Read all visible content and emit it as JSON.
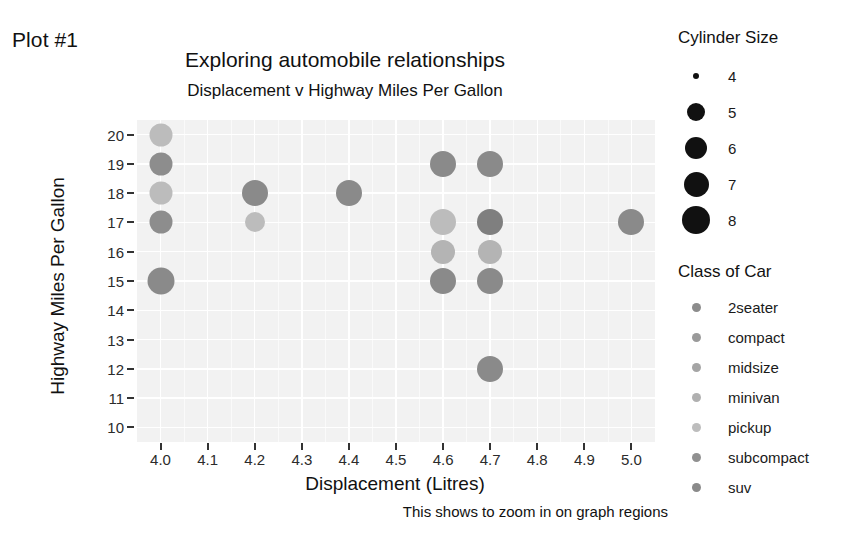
{
  "figure": {
    "plot_label": "Plot #1",
    "title": "Exploring automobile relationships",
    "subtitle": "Displacement v Highway Miles Per Gallon",
    "caption": "This shows to zoom in on graph regions"
  },
  "axes": {
    "x_title": "Displacement (Litres)",
    "y_title": "Highway Miles Per Gallon"
  },
  "legends": {
    "size": {
      "title": "Cylinder Size",
      "entries": [
        {
          "label": "4",
          "value": 4,
          "radius_px": 3
        },
        {
          "label": "5",
          "value": 5,
          "radius_px": 9
        },
        {
          "label": "6",
          "value": 6,
          "radius_px": 11
        },
        {
          "label": "7",
          "value": 7,
          "radius_px": 12.5
        },
        {
          "label": "8",
          "value": 8,
          "radius_px": 14
        }
      ]
    },
    "class": {
      "title": "Class of Car",
      "entries": [
        {
          "label": "2seater",
          "color": "#8c8c8c"
        },
        {
          "label": "compact",
          "color": "#9a9a9a"
        },
        {
          "label": "midsize",
          "color": "#a5a5a5"
        },
        {
          "label": "minivan",
          "color": "#b0b0b0"
        },
        {
          "label": "pickup",
          "color": "#bdbdbd"
        },
        {
          "label": "subcompact",
          "color": "#909090"
        },
        {
          "label": "suv",
          "color": "#8a8a8a"
        }
      ]
    }
  },
  "chart_data": {
    "type": "scatter",
    "title": "Exploring automobile relationships",
    "subtitle": "Displacement v Highway Miles Per Gallon",
    "xlabel": "Displacement (Litres)",
    "ylabel": "Highway Miles Per Gallon",
    "caption": "This shows to zoom in on graph regions",
    "xlim": [
      3.95,
      5.05
    ],
    "ylim": [
      9.5,
      20.5
    ],
    "xticks": [
      "4.0",
      "4.1",
      "4.2",
      "4.3",
      "4.4",
      "4.5",
      "4.6",
      "4.7",
      "4.8",
      "4.9",
      "5.0"
    ],
    "xtick_values": [
      4.0,
      4.1,
      4.2,
      4.3,
      4.4,
      4.5,
      4.6,
      4.7,
      4.8,
      4.9,
      5.0
    ],
    "yticks": [
      "20",
      "19",
      "18",
      "17",
      "16",
      "15",
      "14",
      "13",
      "12",
      "11",
      "10"
    ],
    "ytick_values": [
      20,
      19,
      18,
      17,
      16,
      15,
      14,
      13,
      12,
      11,
      10
    ],
    "grid": true,
    "legend_position": "right",
    "panel_background": "#f2f2f2",
    "size_encoding": "Cylinder Size",
    "color_encoding": "Class of Car",
    "points": [
      {
        "x": 4.0,
        "y": 20,
        "color": "#bcbcbc",
        "r": 11.5,
        "class": "pickup",
        "cyl": 8
      },
      {
        "x": 4.0,
        "y": 19,
        "color": "#8d8d8d",
        "r": 11.5,
        "class": "suv",
        "cyl": 8
      },
      {
        "x": 4.0,
        "y": 18,
        "color": "#bcbcbc",
        "r": 11.5,
        "class": "pickup",
        "cyl": 8
      },
      {
        "x": 4.0,
        "y": 17,
        "color": "#8d8d8d",
        "r": 11.5,
        "class": "suv",
        "cyl": 8
      },
      {
        "x": 4.0,
        "y": 15,
        "color": "#8a8a8a",
        "r": 13.5,
        "class": "suv",
        "cyl": 8
      },
      {
        "x": 4.2,
        "y": 18,
        "color": "#8a8a8a",
        "r": 13.0,
        "class": "suv",
        "cyl": 8
      },
      {
        "x": 4.2,
        "y": 17,
        "color": "#bcbcbc",
        "r": 10.0,
        "class": "pickup",
        "cyl": 8
      },
      {
        "x": 4.4,
        "y": 18,
        "color": "#8a8a8a",
        "r": 13.0,
        "class": "suv",
        "cyl": 8
      },
      {
        "x": 4.6,
        "y": 19,
        "color": "#8a8a8a",
        "r": 13.0,
        "class": "suv",
        "cyl": 8
      },
      {
        "x": 4.6,
        "y": 17,
        "color": "#bcbcbc",
        "r": 13.0,
        "class": "pickup",
        "cyl": 8
      },
      {
        "x": 4.6,
        "y": 16,
        "color": "#b4b4b4",
        "r": 12.0,
        "class": "pickup",
        "cyl": 8
      },
      {
        "x": 4.6,
        "y": 15,
        "color": "#8a8a8a",
        "r": 13.0,
        "class": "suv",
        "cyl": 8
      },
      {
        "x": 4.7,
        "y": 19,
        "color": "#8a8a8a",
        "r": 13.0,
        "class": "suv",
        "cyl": 8
      },
      {
        "x": 4.7,
        "y": 17,
        "color": "#7f7f7f",
        "r": 13.0,
        "class": "suv",
        "cyl": 8
      },
      {
        "x": 4.7,
        "y": 16,
        "color": "#b4b4b4",
        "r": 12.0,
        "class": "pickup",
        "cyl": 8
      },
      {
        "x": 4.7,
        "y": 15,
        "color": "#8a8a8a",
        "r": 13.0,
        "class": "suv",
        "cyl": 8
      },
      {
        "x": 4.7,
        "y": 12,
        "color": "#8a8a8a",
        "r": 13.0,
        "class": "suv",
        "cyl": 8
      },
      {
        "x": 5.0,
        "y": 17,
        "color": "#8a8a8a",
        "r": 13.0,
        "class": "suv",
        "cyl": 8
      }
    ]
  }
}
